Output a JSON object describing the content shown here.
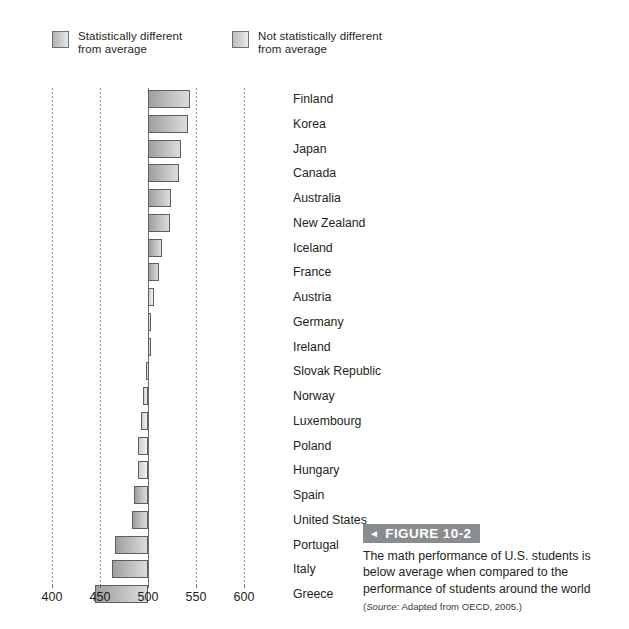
{
  "legend": {
    "items": [
      {
        "label": "Statistically different\nfrom average",
        "swatch": "sig-swatch"
      },
      {
        "label": "Not statistically different\nfrom average",
        "swatch": "nosig-swatch"
      }
    ]
  },
  "caption": {
    "arrow": "◄",
    "title": "FIGURE 10-2",
    "body": "The math performance of U.S. students is below average when compared to the performance of students around the world",
    "source_word": "Source:",
    "source_rest": " Adapted from OECD, 2005.)",
    "source_open": "(",
    "source_full": "(Source: Adapted from OECD, 2005.)"
  },
  "chart_data": {
    "type": "bar",
    "orientation": "horizontal",
    "title": "",
    "xlabel": "",
    "ylabel": "",
    "xlim": [
      395,
      605
    ],
    "xticks": [
      400,
      450,
      500,
      550,
      600
    ],
    "baseline": 500,
    "grid": true,
    "legend_position": "top",
    "categories": [
      "Finland",
      "Korea",
      "Japan",
      "Canada",
      "Australia",
      "New Zealand",
      "Iceland",
      "France",
      "Austria",
      "Germany",
      "Ireland",
      "Slovak Republic",
      "Norway",
      "Luxembourg",
      "Poland",
      "Hungary",
      "Spain",
      "United States",
      "Portugal",
      "Italy",
      "Greece"
    ],
    "values": [
      544,
      542,
      534,
      532,
      524,
      523,
      515,
      511,
      506,
      503,
      503,
      498,
      495,
      493,
      490,
      490,
      485,
      483,
      466,
      462,
      445
    ],
    "significance": [
      "sig",
      "sig",
      "sig",
      "sig",
      "sig",
      "sig",
      "sig",
      "sig",
      "nosig",
      "nosig",
      "nosig",
      "nosig",
      "nosig",
      "nosig",
      "nosig",
      "nosig",
      "sig",
      "sig",
      "sig",
      "sig",
      "sig"
    ],
    "series": [
      {
        "name": "Mean mathematics score",
        "values": [
          544,
          542,
          534,
          532,
          524,
          523,
          515,
          511,
          506,
          503,
          503,
          498,
          495,
          493,
          490,
          490,
          485,
          483,
          466,
          462,
          445
        ]
      }
    ]
  }
}
